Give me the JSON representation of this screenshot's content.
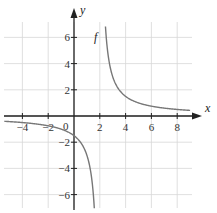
{
  "chart_data": {
    "type": "line",
    "title": "",
    "function_label": "f",
    "function": "f(x) = 3/(x-2)",
    "xlabel": "x",
    "ylabel": "y",
    "xlim": [
      -5,
      9
    ],
    "ylim": [
      -7,
      7
    ],
    "x_ticks": [
      -4,
      -2,
      0,
      2,
      4,
      6,
      8
    ],
    "x_tick_labels": [
      "-4",
      "-2",
      "0",
      "2",
      "4",
      "6",
      "8"
    ],
    "y_ticks": [
      -6,
      -4,
      -2,
      2,
      4,
      6
    ],
    "y_tick_labels": [
      "-6",
      "-4",
      "-2",
      "2",
      "4",
      "6"
    ],
    "grid": true,
    "vertical_asymptote": 2,
    "horizontal_asymptote": 0,
    "series": [
      {
        "name": "f (left branch)",
        "x": [
          -5,
          -4,
          -3,
          -2,
          -1,
          0,
          1,
          1.5,
          1.6
        ],
        "y": [
          -0.43,
          -0.5,
          -0.6,
          -0.75,
          -1.0,
          -1.5,
          -3.0,
          -6.0,
          -7.5
        ]
      },
      {
        "name": "f (right branch)",
        "x": [
          2.43,
          2.5,
          3,
          4,
          5,
          6,
          7,
          8,
          9
        ],
        "y": [
          7.0,
          6.0,
          3.0,
          1.5,
          1.0,
          0.75,
          0.6,
          0.5,
          0.43
        ]
      }
    ]
  }
}
